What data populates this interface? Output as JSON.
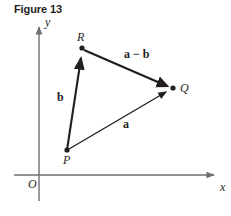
{
  "figure": {
    "title": "Figure 13",
    "caption_number": "13"
  },
  "axes": {
    "x_label": "x",
    "y_label": "y",
    "origin_label": "O",
    "x_axis": {
      "x1": 14,
      "y1": 175,
      "x2": 220,
      "y2": 175
    },
    "y_axis": {
      "x1": 39,
      "y1": 21,
      "x2": 39,
      "y2": 201
    },
    "color": "#6d6e71"
  },
  "points": [
    {
      "name": "R",
      "label": "R",
      "x": 82,
      "y": 48,
      "label_x": 77,
      "label_y": 30
    },
    {
      "name": "Q",
      "label": "Q",
      "x": 173,
      "y": 88,
      "label_x": 180,
      "label_y": 81
    },
    {
      "name": "P",
      "label": "P",
      "x": 67,
      "y": 150,
      "label_x": 63,
      "label_y": 153
    }
  ],
  "vectors": [
    {
      "name": "b",
      "label": "b",
      "from": "P",
      "to": "R",
      "x1": 67,
      "y1": 150,
      "x2": 81,
      "y2": 54,
      "label_x": 57,
      "label_y": 90,
      "stroke_width": 2.2
    },
    {
      "name": "a-minus-b",
      "label": "a − b",
      "from": "R",
      "to": "Q",
      "x1": 84,
      "y1": 50,
      "x2": 169,
      "y2": 87,
      "label_x": 124,
      "label_y": 47,
      "stroke_width": 2.4
    },
    {
      "name": "a",
      "label": "a",
      "from": "P",
      "to": "Q",
      "x1": 69,
      "y1": 149,
      "x2": 169,
      "y2": 90,
      "label_x": 123,
      "label_y": 117,
      "stroke_width": 1.5
    }
  ],
  "colors": {
    "ink": "#231f20",
    "axis": "#6d6e71",
    "background": "#ffffff"
  }
}
